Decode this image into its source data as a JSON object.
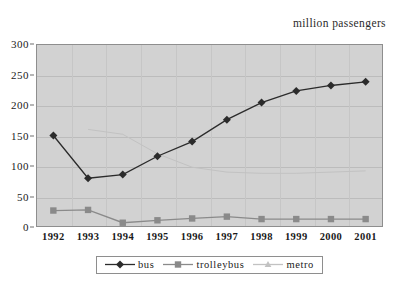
{
  "unit_label": "million passengers",
  "top_bleed_text": "",
  "chart_data": {
    "type": "line",
    "title": "",
    "subtitle": "",
    "xlabel": "",
    "ylabel": "million passengers",
    "categories": [
      "1992",
      "1993",
      "1994",
      "1995",
      "1996",
      "1997",
      "1998",
      "1999",
      "2000",
      "2001"
    ],
    "ylim": [
      0,
      300
    ],
    "y_ticks": [
      0,
      50,
      100,
      150,
      200,
      250,
      300
    ],
    "xlim_categories": 10,
    "grid": true,
    "legend_position": "bottom",
    "plot_background": "#d2d2d2",
    "series": [
      {
        "name": "bus",
        "color": "#2b2b2b",
        "marker": "diamond",
        "values": [
          150,
          80,
          86,
          116,
          140,
          176,
          204,
          223,
          232,
          238
        ]
      },
      {
        "name": "trolleybus",
        "color": "#8a8a8a",
        "marker": "square",
        "values": [
          27,
          28,
          7,
          11,
          14,
          17,
          13,
          13,
          13,
          13
        ]
      },
      {
        "name": "metro",
        "color": "#c2c2c2",
        "marker": "triangle",
        "values": [
          null,
          160,
          152,
          120,
          98,
          90,
          88,
          88,
          90,
          92
        ]
      }
    ]
  },
  "legend": {
    "items": [
      {
        "label": "bus",
        "color": "#2b2b2b",
        "marker": "diamond"
      },
      {
        "label": "trolleybus",
        "color": "#8a8a8a",
        "marker": "square"
      },
      {
        "label": "metro",
        "color": "#c2c2c2",
        "marker": "triangle"
      }
    ]
  }
}
